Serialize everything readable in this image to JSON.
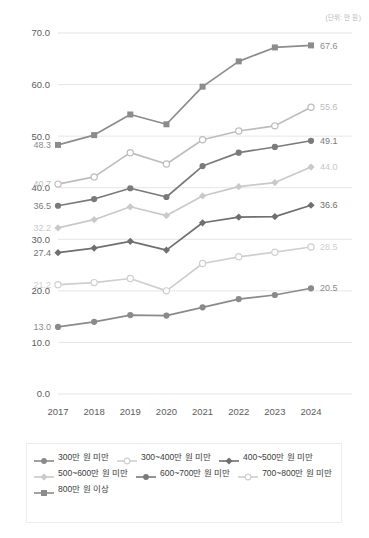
{
  "unit_note": "(단위: 만 원)",
  "chart_data": {
    "type": "line",
    "title": "",
    "subtitle": "",
    "xlabel": "",
    "ylabel": "",
    "unit": "(단위: 만 원)",
    "grid": true,
    "legend_position": "bottom",
    "ylim": [
      0,
      70
    ],
    "yticks": [
      "0.0",
      "10.0",
      "20.0",
      "30.0",
      "40.0",
      "50.0",
      "60.0",
      "70.0"
    ],
    "ytick_values": [
      0,
      10,
      20,
      30,
      40,
      50,
      60,
      70
    ],
    "categories": [
      "2017",
      "2018",
      "2019",
      "2020",
      "2021",
      "2022",
      "2023",
      "2024"
    ],
    "series": [
      {
        "name": "800만 원 이상",
        "color": "#8c8c8c",
        "marker": "square-filled",
        "start_label": "48.3",
        "end_label": "67.6",
        "values": [
          48.3,
          50.2,
          54.2,
          52.3,
          59.6,
          64.5,
          67.2,
          67.6
        ]
      },
      {
        "name": "700~800만 원 미만",
        "color": "#bdbdbd",
        "marker": "circle-open",
        "start_label": "40.7",
        "end_label": "55.6",
        "values": [
          40.7,
          42.1,
          46.8,
          44.6,
          49.3,
          51.0,
          52.0,
          55.6
        ]
      },
      {
        "name": "600~700만 원 미만",
        "color": "#7a7a7a",
        "marker": "circle-filled",
        "start_label": "36.5",
        "end_label": "49.1",
        "values": [
          36.5,
          37.8,
          39.9,
          38.2,
          44.2,
          46.8,
          47.9,
          49.1
        ]
      },
      {
        "name": "500~600만 원 미만",
        "color": "#c9c9c9",
        "marker": "diamond-filled",
        "start_label": "32.2",
        "end_label": "44.0",
        "values": [
          32.2,
          33.8,
          36.3,
          34.6,
          38.4,
          40.2,
          41.0,
          44.0
        ]
      },
      {
        "name": "400~500만 원 미만",
        "color": "#6f6f6f",
        "marker": "diamond-filled",
        "start_label": "27.4",
        "end_label": "36.6",
        "values": [
          27.4,
          28.3,
          29.6,
          27.9,
          33.2,
          34.3,
          34.4,
          36.6
        ]
      },
      {
        "name": "300~400만 원 미만",
        "color": "#cfcfcf",
        "marker": "circle-open",
        "start_label": "21.2",
        "end_label": "28.5",
        "values": [
          21.2,
          21.6,
          22.4,
          20.0,
          25.3,
          26.6,
          27.5,
          28.5
        ]
      },
      {
        "name": "300만 원 미만",
        "color": "#8a8a8a",
        "marker": "circle-filled",
        "start_label": "13.0",
        "end_label": "20.5",
        "values": [
          13.0,
          14.0,
          15.3,
          15.2,
          16.8,
          18.4,
          19.2,
          20.5
        ]
      }
    ]
  },
  "legend": {
    "rows": [
      [
        {
          "label": "300만 원 미만",
          "color": "#8a8a8a",
          "marker": "circle-filled"
        },
        {
          "label": "300~400만 원 미만",
          "color": "#cfcfcf",
          "marker": "circle-open"
        },
        {
          "label": "400~500만 원 미만",
          "color": "#6f6f6f",
          "marker": "diamond-filled"
        }
      ],
      [
        {
          "label": "500~600만 원 미만",
          "color": "#c9c9c9",
          "marker": "diamond-filled"
        },
        {
          "label": "600~700만 원 미만",
          "color": "#7a7a7a",
          "marker": "circle-filled"
        },
        {
          "label": "700~800만 원 미만",
          "color": "#cfcfcf",
          "marker": "circle-open"
        }
      ],
      [
        {
          "label": "800만 원 이상",
          "color": "#8c8c8c",
          "marker": "square-filled"
        }
      ]
    ]
  }
}
